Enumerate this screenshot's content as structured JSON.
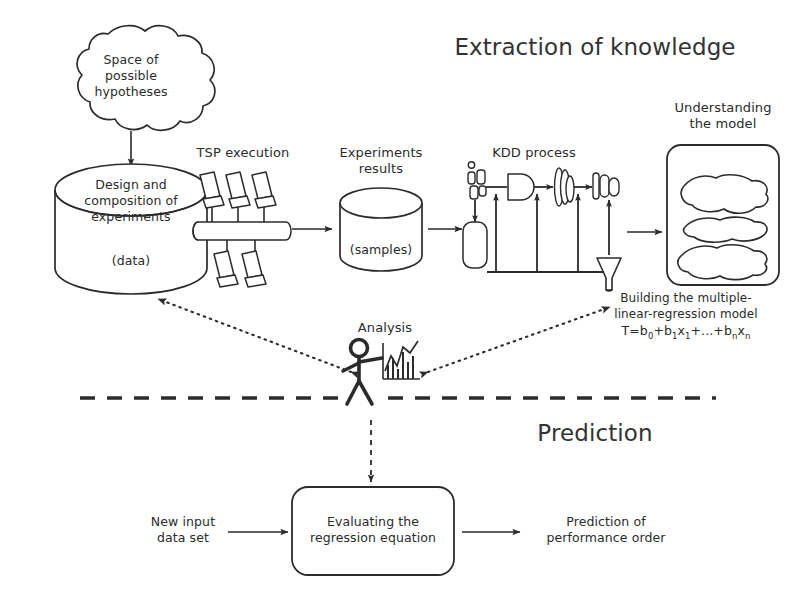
{
  "figure": {
    "background_color": "#ffffff",
    "ink_color": "#2b2b2b",
    "sections": {
      "top_title": "Extraction of knowledge",
      "bottom_title": "Prediction"
    }
  },
  "top_flow": {
    "hypotheses_cloud": {
      "line1": "Space of",
      "line2": "possible",
      "line3": "hypotheses"
    },
    "design_cylinder": {
      "line1": "Design and",
      "line2": "composition of",
      "line3": "experiments",
      "bottom_label": "(data)"
    },
    "tsp_stage": {
      "caption": "TSP execution",
      "computer_count": 5
    },
    "experiments_cylinder": {
      "caption_line1": "Experiments",
      "caption_line2": "results",
      "bottom_label": "(samples)"
    },
    "kdd_stage": {
      "caption": "KDD process"
    },
    "understanding_box": {
      "caption_line1": "Understanding",
      "caption_line2": "the model",
      "blob_count": 3,
      "note_line1": "Building the multiple-",
      "note_line2": "linear-regression model",
      "formula_prefix": "T=b",
      "formula_sub1": "0",
      "formula_mid1": "+b",
      "formula_sub2": "1",
      "formula_mid2": "x",
      "formula_sub3": "1",
      "formula_mid3": "+...+b",
      "formula_sub4": "n",
      "formula_mid4": "x",
      "formula_sub5": "n",
      "formula_plain": "T=b0+b1x1+...+bnxn"
    }
  },
  "analysis": {
    "caption": "Analysis"
  },
  "bottom_flow": {
    "input_label_line1": "New input",
    "input_label_line2": "data set",
    "evaluate_box_line1": "Evaluating the",
    "evaluate_box_line2": "regression equation",
    "output_label_line1": "Prediction of",
    "output_label_line2": "performance order"
  }
}
